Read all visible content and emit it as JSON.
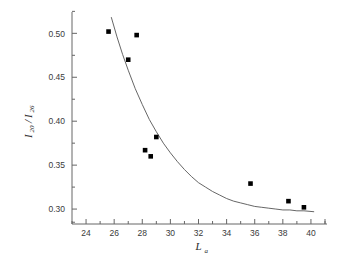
{
  "chart_data": {
    "type": "scatter",
    "title": "",
    "subtitle": "",
    "xlabel": "L_a",
    "xlabel_base": "L",
    "xlabel_sub": "a",
    "ylabel": "I_20/I_26",
    "ylabel_parts": {
      "num_base": "I",
      "num_sub": "20",
      "slash": "/",
      "den_base": "I",
      "den_sub": "26"
    },
    "xlim": [
      23.0,
      41.0
    ],
    "ylim": [
      0.283,
      0.522
    ],
    "xticks": [
      24,
      26,
      28,
      30,
      32,
      34,
      36,
      38,
      40
    ],
    "xtick_labels": [
      "24",
      "26",
      "28",
      "30",
      "32",
      "34",
      "36",
      "38",
      "40"
    ],
    "yticks": [
      0.3,
      0.35,
      0.4,
      0.45,
      0.5
    ],
    "ytick_labels": [
      "0.30",
      "0.35",
      "0.40",
      "0.45",
      "0.50"
    ],
    "x_minor_per_major": 2,
    "y_minor_per_major": 2,
    "grid": false,
    "legend": false,
    "legend_position": "none",
    "marker": "filled-square",
    "marker_color": "#000000",
    "marker_size": 4.6,
    "curve_color": "#555555",
    "curve_width": 0.9,
    "axis_color": "#666666",
    "series": [
      {
        "name": "measured",
        "x": [
          25.6,
          27.0,
          27.6,
          28.2,
          28.6,
          29.0,
          35.7,
          38.4,
          39.5
        ],
        "y": [
          0.502,
          0.47,
          0.498,
          0.367,
          0.36,
          0.382,
          0.329,
          0.309,
          0.302
        ]
      }
    ],
    "fit_curve": {
      "name": "exponential-decay-fit",
      "x": [
        25.8,
        26.2,
        26.6,
        27.0,
        27.5,
        28.0,
        28.5,
        29.0,
        29.5,
        30.0,
        30.5,
        31.0,
        31.5,
        32.0,
        32.5,
        33.0,
        33.5,
        34.0,
        34.5,
        35.0,
        35.5,
        36.0,
        36.5,
        37.0,
        37.5,
        38.0,
        38.5,
        39.0,
        39.5,
        40.2
      ],
      "y": [
        0.518,
        0.496,
        0.476,
        0.458,
        0.437,
        0.419,
        0.402,
        0.388,
        0.375,
        0.364,
        0.354,
        0.345,
        0.337,
        0.33,
        0.325,
        0.32,
        0.316,
        0.312,
        0.309,
        0.307,
        0.305,
        0.303,
        0.302,
        0.301,
        0.3,
        0.299,
        0.299,
        0.298,
        0.298,
        0.297
      ]
    }
  },
  "figure": {
    "background": "#ffffff",
    "caption": ""
  }
}
